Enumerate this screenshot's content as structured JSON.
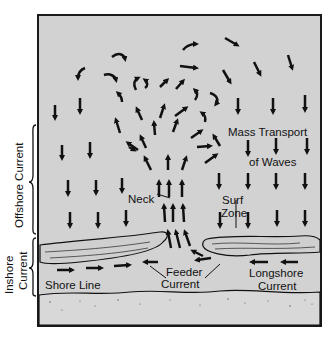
{
  "diagram": {
    "colors": {
      "water": "#d2d2d2",
      "sand": "#d6d6d6",
      "ink": "#111111",
      "frame": "#1a1a1a"
    },
    "labels": {
      "mass_transport_line1": "Mass Transport",
      "mass_transport_line2": "of Waves",
      "neck": "Neck",
      "surf_line1": "Surf",
      "surf_line2": "Zone",
      "feeder_line1": "Feeder",
      "feeder_line2": "Current",
      "longshore_line1": "Longshore",
      "longshore_line2": "Current",
      "shore_line": "Shore Line",
      "offshore_current": "Offshore Current",
      "inshore_line1": "Inshore",
      "inshore_line2": "Current"
    },
    "regions": [
      "Offshore Current",
      "Inshore Current"
    ],
    "arrows": {
      "mass_transport": "down (toward shore)",
      "neck": "up (seaward)",
      "feeder_current": "converging toward rip neck",
      "longshore_current": "parallel to shore"
    }
  }
}
